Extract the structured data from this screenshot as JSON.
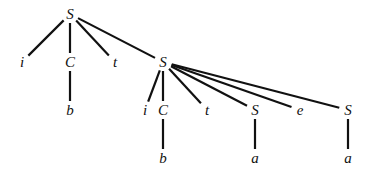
{
  "diagram": {
    "type": "parse-tree",
    "nodes": [
      {
        "id": "n0",
        "label": "S",
        "x": 70,
        "y": 14
      },
      {
        "id": "n1",
        "label": "i",
        "x": 22,
        "y": 62
      },
      {
        "id": "n2",
        "label": "C",
        "x": 70,
        "y": 62
      },
      {
        "id": "n3",
        "label": "t",
        "x": 115,
        "y": 62
      },
      {
        "id": "n4",
        "label": "S",
        "x": 163,
        "y": 62
      },
      {
        "id": "n5",
        "label": "b",
        "x": 70,
        "y": 110
      },
      {
        "id": "n6",
        "label": "i",
        "x": 145,
        "y": 110
      },
      {
        "id": "n7",
        "label": "C",
        "x": 163,
        "y": 110
      },
      {
        "id": "n8",
        "label": "t",
        "x": 207,
        "y": 110
      },
      {
        "id": "n9",
        "label": "S",
        "x": 255,
        "y": 110
      },
      {
        "id": "n10",
        "label": "e",
        "x": 300,
        "y": 110
      },
      {
        "id": "n11",
        "label": "S",
        "x": 348,
        "y": 110
      },
      {
        "id": "n12",
        "label": "b",
        "x": 163,
        "y": 158
      },
      {
        "id": "n13",
        "label": "a",
        "x": 255,
        "y": 158
      },
      {
        "id": "n14",
        "label": "a",
        "x": 348,
        "y": 158
      }
    ],
    "edges": [
      [
        "n0",
        "n1"
      ],
      [
        "n0",
        "n2"
      ],
      [
        "n0",
        "n3"
      ],
      [
        "n0",
        "n4"
      ],
      [
        "n2",
        "n5"
      ],
      [
        "n4",
        "n6"
      ],
      [
        "n4",
        "n7"
      ],
      [
        "n4",
        "n8"
      ],
      [
        "n4",
        "n9"
      ],
      [
        "n4",
        "n10"
      ],
      [
        "n4",
        "n11"
      ],
      [
        "n7",
        "n12"
      ],
      [
        "n9",
        "n13"
      ],
      [
        "n11",
        "n14"
      ]
    ]
  }
}
